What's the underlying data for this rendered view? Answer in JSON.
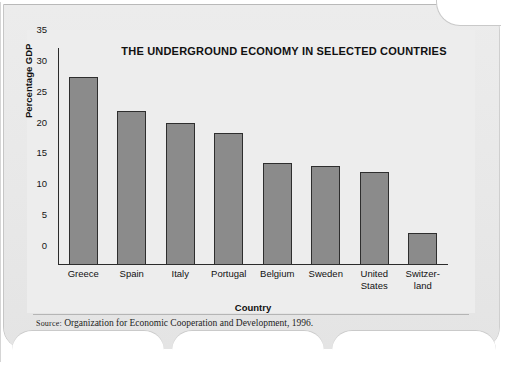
{
  "figure": {
    "source_prefix": "Source:",
    "source_text": "Organization for Economic Cooperation and Development, 1996."
  },
  "chart_data": {
    "type": "bar",
    "title": "THE UNDERGROUND ECONOMY IN SELECTED COUNTRIES",
    "xlabel": "Country",
    "ylabel": "Percentage GDP",
    "categories": [
      "Greece",
      "Spain",
      "Italy",
      "Portugal",
      "Belgium",
      "Sweden",
      "United States",
      "Switzerland"
    ],
    "category_labels": [
      [
        "Greece"
      ],
      [
        "Spain"
      ],
      [
        "Italy"
      ],
      [
        "Portugal"
      ],
      [
        "Belgium"
      ],
      [
        "Sweden"
      ],
      [
        "United",
        "States"
      ],
      [
        "Switzer-",
        "land"
      ]
    ],
    "values": [
      30.5,
      25.0,
      23.0,
      21.4,
      16.5,
      16.0,
      15.0,
      5.2
    ],
    "ylim": [
      0,
      35
    ],
    "yticks": [
      35,
      30,
      25,
      20,
      15,
      10,
      5,
      0
    ],
    "ytick_labels": [
      "35",
      "30",
      "25",
      "20",
      "15",
      "10",
      "5",
      "0"
    ],
    "grid": false,
    "legend": false,
    "bar_color": "#8b8b8b",
    "bar_edge_color": "#2e2e2e",
    "plot_background": "#ededed"
  }
}
